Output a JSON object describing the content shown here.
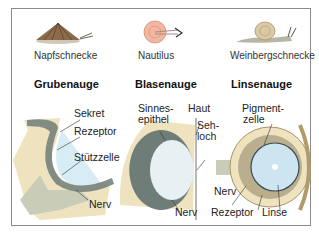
{
  "species": [
    {
      "name": "Napfschnecke",
      "icon": "limpet-icon"
    },
    {
      "name": "Nautilus",
      "icon": "nautilus-icon"
    },
    {
      "name": "Weinbergschnecke",
      "icon": "snail-icon"
    }
  ],
  "eye_types": [
    {
      "title": "Grubenauge",
      "labels": [
        "Sekret",
        "Rezeptor",
        "Stützzelle",
        "Nerv"
      ]
    },
    {
      "title": "Blasenauge",
      "labels": [
        "Sinnes-",
        "epithel",
        "Haut",
        "Seh-",
        "loch",
        "Nerv"
      ]
    },
    {
      "title": "Linsenauge",
      "labels": [
        "Pigment-",
        "zelle",
        "Nerv",
        "Rezeptor",
        "Linse"
      ]
    }
  ],
  "colors": {
    "frame": "#8a8a8a",
    "tissue": "#efe2bf",
    "nerve": "#c9cdb8",
    "fluid": "#d7ecf5",
    "receptor": "#6e7d78",
    "text": "#222222"
  }
}
